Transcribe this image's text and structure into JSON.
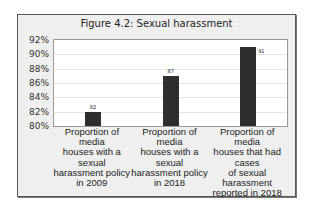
{
  "chart_data": {
    "type": "bar",
    "title": "Figure 4.2: Sexual harassment",
    "categories": [
      "Proportion of\nmedia\nhouses with a\nsexual\nharassment policy\nin 2009",
      "Proportion of\nmedia\nhouses with a\nsexual\nharassment policy\nin 2018",
      "Proportion of\nmedia\nhouses that had\ncases\nof sexual\nharassment\nreported in 2018"
    ],
    "values": [
      82,
      87,
      91
    ],
    "data_labels": [
      "82",
      "87",
      "91"
    ],
    "xlabel": "",
    "ylabel": "",
    "ylim": [
      80,
      92
    ],
    "yticks": [
      "80%",
      "82%",
      "84%",
      "86%",
      "88%",
      "90%",
      "92%"
    ],
    "grid": true,
    "legend": "none",
    "bar_color": "#2e2e2e"
  }
}
